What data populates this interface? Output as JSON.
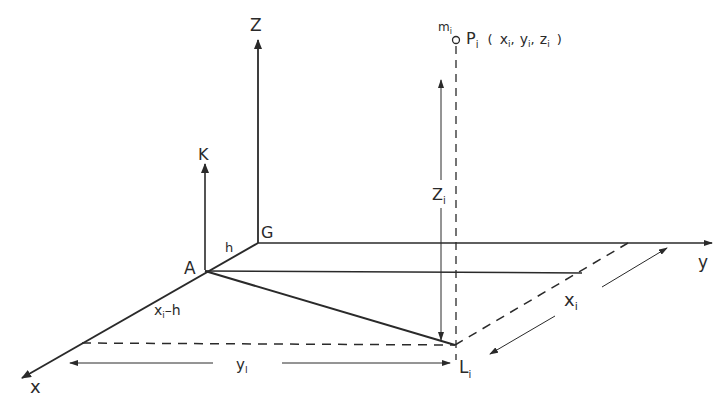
{
  "diagram": {
    "type": "3d-coordinate-geometry",
    "colors": {
      "stroke": "#2a2a2a",
      "background": "#ffffff"
    },
    "axes": {
      "z": {
        "label": "Z"
      },
      "k": {
        "label": "K"
      },
      "y": {
        "label": "y"
      },
      "x": {
        "label": "x"
      }
    },
    "points": {
      "origin_g": {
        "label": "G"
      },
      "point_a": {
        "label": "A"
      },
      "point_p": {
        "label": "P",
        "sub": "i",
        "coords_text": "( x",
        "coords": [
          {
            "name": "x",
            "sub": "i"
          },
          {
            "name": "y",
            "sub": "i"
          },
          {
            "name": "z",
            "sub": "i"
          }
        ]
      },
      "point_l": {
        "label": "L",
        "sub": "i"
      },
      "mass": {
        "label": "m",
        "sub": "i"
      }
    },
    "dimensions": {
      "h": {
        "label": "h"
      },
      "xi_minus_h": {
        "label": "x",
        "sub": "i",
        "suffix": "–h"
      },
      "y_i": {
        "label": "y",
        "sub": "I"
      },
      "x_i": {
        "label": "x",
        "sub": "i"
      },
      "z_i": {
        "label": "Z",
        "sub": "i"
      }
    },
    "punctuation": {
      "open": "(",
      "close": ")",
      "comma": ","
    }
  }
}
